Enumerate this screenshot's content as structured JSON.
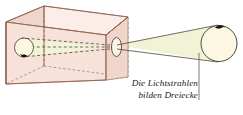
{
  "figure": {
    "caption": {
      "line1": "Die Lichtstrahlen",
      "line2": "bilden Dreiecke"
    },
    "parts": {
      "box": "Lochkamera (Schachtel)",
      "pinhole": "Loch",
      "object": "Gegenstand",
      "image": "umgekehrtes Bild",
      "light_cone": "Lichtbündel",
      "leader": "Hinweislinie"
    },
    "colors": {
      "box_front": "#f6e2d9",
      "box_side": "#f0d5cb",
      "box_top": "#fbeee8",
      "box_outline": "#b08070",
      "light_cone": "#f2f2d6",
      "ray_line": "#4a4a3a",
      "dashed_edge": "#a08478",
      "object_fill": "#fbf7e2",
      "mark": "#1a1a1a",
      "caption_text": "#1a1a1a",
      "background": "#ffffff"
    }
  }
}
